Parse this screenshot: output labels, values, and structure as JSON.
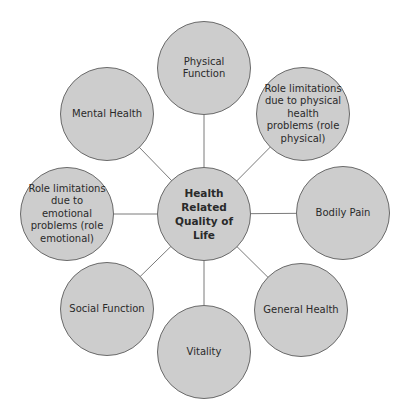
{
  "diagram": {
    "center": {
      "label": "Health Related Quality of Life"
    },
    "nodes": [
      {
        "label": "Physical Function"
      },
      {
        "label": "Role limitations due to physical health problems (role physical)"
      },
      {
        "label": "Bodily Pain"
      },
      {
        "label": "General Health"
      },
      {
        "label": "Vitality"
      },
      {
        "label": "Social Function"
      },
      {
        "label": "Role limitations due to emotional problems (role emotional)"
      },
      {
        "label": "Mental Health"
      }
    ],
    "colors": {
      "fill": "#cdcdcd",
      "stroke": "#6a6a6a",
      "connector": "#7a7a7a"
    }
  }
}
